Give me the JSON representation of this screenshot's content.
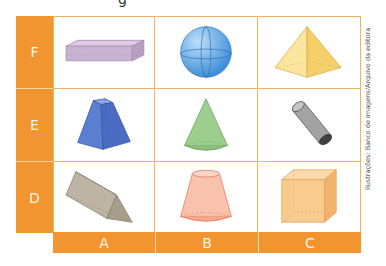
{
  "top_fragment_text": "g",
  "rows": [
    {
      "label": "F",
      "shapes": [
        "rectangular-prism",
        "sphere",
        "square-pyramid"
      ]
    },
    {
      "label": "E",
      "shapes": [
        "frustum-of-pyramid",
        "cone",
        "cylinder"
      ]
    },
    {
      "label": "D",
      "shapes": [
        "triangular-prism",
        "frustum-of-cone",
        "cube"
      ]
    }
  ],
  "columns": [
    "A",
    "B",
    "C"
  ],
  "shape_colors": {
    "rectangular-prism": "#c9b3d3",
    "sphere": "#6fb3ea",
    "square-pyramid": "#f7d77a",
    "frustum-of-pyramid": "#5b7fd1",
    "cone": "#9fcf8f",
    "cylinder": "#9a9a9a",
    "triangular-prism": "#b6ad9c",
    "frustum-of-cone": "#f6a98e",
    "cube": "#f7c88a"
  },
  "header_color": "#f0952f",
  "credit": "Ilustrações: Banco de imagens/Arquivo da editora"
}
